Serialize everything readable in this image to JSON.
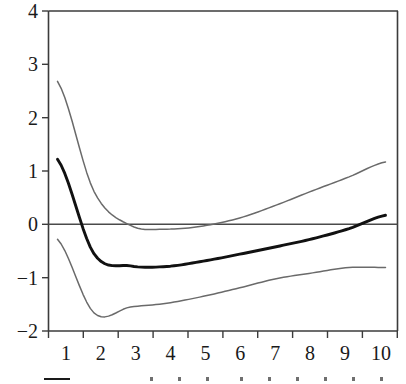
{
  "chart_data": {
    "type": "line",
    "title": "",
    "subtitle": "",
    "xlabel": "",
    "ylabel": "",
    "xlim": [
      0.6,
      10.4
    ],
    "ylim": [
      -2,
      4
    ],
    "grid": false,
    "legend_position": "bottom",
    "x": [
      1,
      2,
      3,
      4,
      5,
      6,
      7,
      8,
      9,
      10
    ],
    "x_tick_labels": [
      "1",
      "2",
      "3",
      "4",
      "5",
      "6",
      "7",
      "8",
      "9",
      "10"
    ],
    "y_tick_labels": [
      "4",
      "3",
      "2",
      "1",
      "0",
      "−1",
      "−2"
    ],
    "y_ticks": [
      4,
      3,
      2,
      1,
      0,
      -1,
      -2
    ],
    "zero_reference_line": 0,
    "series": [
      {
        "name": "upper-confidence-band",
        "style": "thin-gray",
        "color": "#6a6a6a",
        "values": [
          2.68,
          0.62,
          -0.02,
          -0.09,
          -0.03,
          0.12,
          0.36,
          0.63,
          0.89,
          1.17
        ]
      },
      {
        "name": "point-estimate",
        "style": "bold-black",
        "color": "#111111",
        "values": [
          1.22,
          -0.55,
          -0.78,
          -0.79,
          -0.69,
          -0.56,
          -0.42,
          -0.27,
          -0.08,
          0.17
        ]
      },
      {
        "name": "lower-confidence-band",
        "style": "thin-gray",
        "color": "#6a6a6a",
        "values": [
          -0.28,
          -1.66,
          -1.55,
          -1.48,
          -1.35,
          -1.19,
          -1.02,
          -0.91,
          -0.81,
          -0.81
        ]
      }
    ],
    "annotations": [],
    "legend_entries": []
  },
  "legend": {
    "swatch_name": "solid-line-swatch",
    "dot_count": 9
  }
}
